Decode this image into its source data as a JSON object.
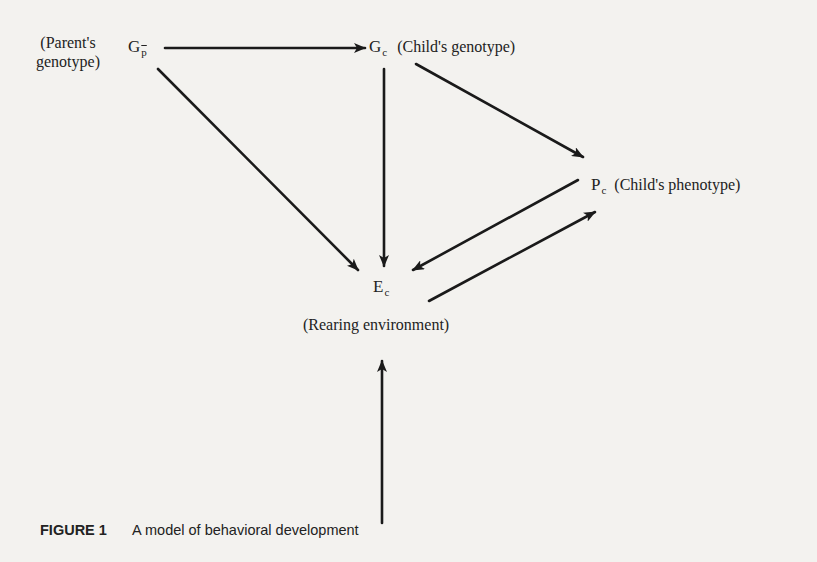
{
  "diagram": {
    "title": "A model of behavioral development",
    "nodes": [
      {
        "id": "Gp",
        "symbol": "G",
        "subscript": "p",
        "subscript_overline": true,
        "label_line1": "(Parent's",
        "label_line2": "genotype)"
      },
      {
        "id": "Gc",
        "symbol": "G",
        "subscript": "c",
        "label": "(Child's genotype)"
      },
      {
        "id": "Pc",
        "symbol": "P",
        "subscript": "c",
        "label": "(Child's phenotype)"
      },
      {
        "id": "Ec",
        "symbol": "E",
        "subscript": "c",
        "label": "(Rearing environment)"
      }
    ],
    "edges": [
      {
        "from": "Gp",
        "to": "Gc"
      },
      {
        "from": "Gp",
        "to": "Ec"
      },
      {
        "from": "Gc",
        "to": "Ec"
      },
      {
        "from": "Gc",
        "to": "Pc"
      },
      {
        "from": "Pc",
        "to": "Ec"
      },
      {
        "from": "Ec",
        "to": "Pc"
      },
      {
        "from": "external",
        "to": "Ec"
      }
    ],
    "line_color": "#1a1a1a",
    "background_color": "#f3f2ef"
  },
  "caption": {
    "figure_label": "FIGURE 1",
    "text": "A model of behavioral development"
  }
}
